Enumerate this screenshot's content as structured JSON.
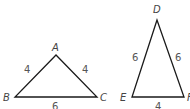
{
  "colors": {
    "stroke": "#1a1a1a",
    "vertex_label": "#444444",
    "side_label": "#555555",
    "background": "#ffffff"
  },
  "triangles": [
    {
      "name": "ABC",
      "vertices": {
        "A": {
          "label": "A"
        },
        "B": {
          "label": "B"
        },
        "C": {
          "label": "C"
        }
      },
      "sides": {
        "AB": "4",
        "AC": "4",
        "BC": "6"
      }
    },
    {
      "name": "DEF",
      "vertices": {
        "D": {
          "label": "D"
        },
        "E": {
          "label": "E"
        },
        "F": {
          "label": "F"
        }
      },
      "sides": {
        "DE": "6",
        "DF": "6",
        "EF": "4"
      }
    }
  ]
}
